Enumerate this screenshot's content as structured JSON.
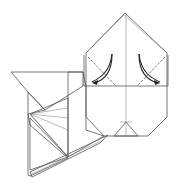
{
  "diagram": {
    "type": "origami-folding-step",
    "colors": {
      "paper_white": "#ffffff",
      "paper_gray": "#a6a6a6",
      "line": "#555555",
      "arrow": "#222222"
    },
    "annotations": {
      "fold_lines": "valley-fold (dashed) on both upper corners",
      "arrows": [
        "curved arrow left corner folding inward",
        "curved arrow right corner folding inward"
      ]
    }
  }
}
